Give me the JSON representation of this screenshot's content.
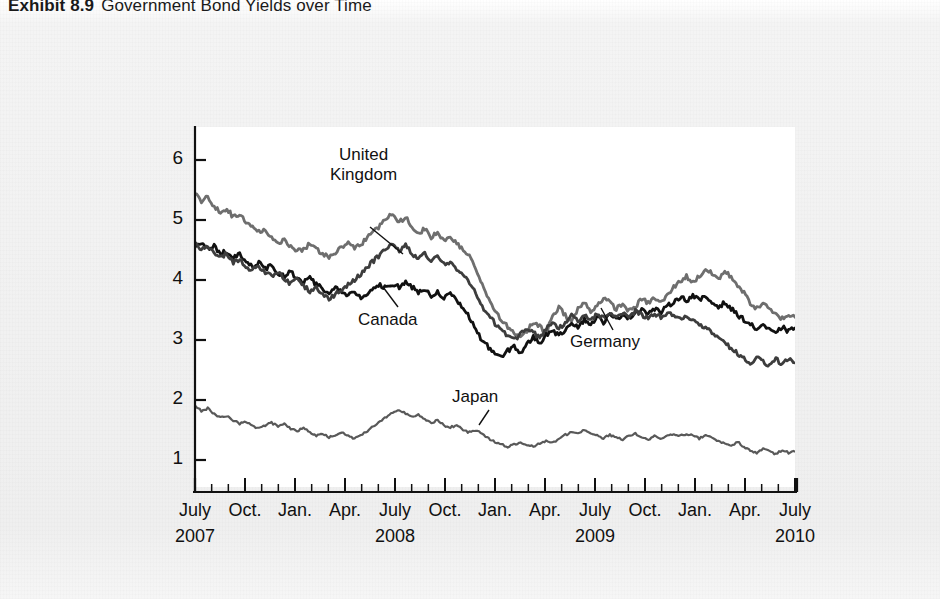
{
  "caption": {
    "exhibit_label": "Exhibit 8.9",
    "title": "Government Bond Yields over Time"
  },
  "chart_data": {
    "type": "line",
    "title": "Government Bond Yields over Time",
    "xlabel": "",
    "ylabel": "Percent",
    "ylim": [
      0.55,
      6.55
    ],
    "yticks": [
      1,
      2,
      3,
      4,
      5,
      6
    ],
    "ytick_labels": [
      "1",
      "2",
      "3",
      "4",
      "5",
      "6"
    ],
    "grid": false,
    "legend": "inline-annotations",
    "x_axis": {
      "tick_interval": "monthly",
      "major_tick_interval": "quarterly",
      "month_labels": [
        "July",
        "Oct.",
        "Jan.",
        "Apr.",
        "July",
        "Oct.",
        "Jan.",
        "Apr.",
        "July",
        "Oct.",
        "Jan.",
        "Apr.",
        "July"
      ],
      "year_labels": [
        "2007",
        "2008",
        "2009",
        "2010"
      ],
      "year_label_at_month": [
        "July",
        "July",
        "July",
        "July"
      ],
      "range": [
        "2007-07",
        "2010-08"
      ]
    },
    "annotations": [
      {
        "text": "United Kingdom",
        "series": "United Kingdom",
        "color": "#6e6e6e"
      },
      {
        "text": "Canada",
        "series": "Canada",
        "color": "#111111"
      },
      {
        "text": "Germany",
        "series": "Germany",
        "color": "#3d3d3d"
      },
      {
        "text": "Japan",
        "series": "Japan",
        "color": "#595959"
      }
    ],
    "series": [
      {
        "name": "United Kingdom",
        "color": "#6e6e6e",
        "values": [
          5.45,
          5.28,
          5.4,
          5.22,
          5.12,
          5.18,
          5.05,
          5.1,
          4.95,
          4.88,
          4.8,
          4.86,
          4.7,
          4.62,
          4.66,
          4.55,
          4.48,
          4.52,
          4.6,
          4.52,
          4.44,
          4.38,
          4.46,
          4.55,
          4.62,
          4.52,
          4.6,
          4.7,
          4.82,
          4.9,
          5.02,
          5.12,
          4.96,
          5.06,
          4.9,
          4.78,
          4.86,
          4.72,
          4.78,
          4.66,
          4.74,
          4.6,
          4.5,
          4.4,
          4.2,
          3.92,
          3.7,
          3.48,
          3.34,
          3.22,
          3.1,
          3.02,
          3.15,
          3.3,
          3.22,
          3.12,
          3.4,
          3.55,
          3.42,
          3.3,
          3.52,
          3.62,
          3.48,
          3.58,
          3.7,
          3.62,
          3.52,
          3.6,
          3.48,
          3.56,
          3.68,
          3.62,
          3.7,
          3.62,
          3.74,
          3.88,
          3.98,
          4.06,
          3.96,
          4.06,
          4.18,
          4.1,
          4.02,
          4.14,
          4.05,
          3.92,
          3.78,
          3.62,
          3.52,
          3.62,
          3.5,
          3.42,
          3.36,
          3.42,
          3.38
        ]
      },
      {
        "name": "Canada",
        "color": "#111111",
        "values": [
          4.58,
          4.62,
          4.52,
          4.56,
          4.44,
          4.48,
          4.38,
          4.42,
          4.3,
          4.22,
          4.3,
          4.18,
          4.24,
          4.12,
          4.06,
          4.14,
          4.02,
          3.96,
          4.04,
          3.92,
          3.86,
          3.78,
          3.88,
          3.8,
          3.74,
          3.8,
          3.7,
          3.78,
          3.84,
          3.92,
          3.86,
          3.94,
          3.88,
          3.96,
          3.88,
          3.8,
          3.86,
          3.74,
          3.8,
          3.7,
          3.76,
          3.66,
          3.52,
          3.38,
          3.18,
          2.98,
          2.88,
          2.78,
          2.7,
          2.82,
          2.9,
          2.78,
          2.92,
          3.05,
          2.95,
          3.08,
          3.18,
          3.06,
          3.18,
          3.3,
          3.22,
          3.34,
          3.26,
          3.38,
          3.3,
          3.42,
          3.34,
          3.44,
          3.36,
          3.46,
          3.52,
          3.44,
          3.52,
          3.46,
          3.56,
          3.64,
          3.72,
          3.66,
          3.74,
          3.66,
          3.72,
          3.62,
          3.56,
          3.62,
          3.52,
          3.42,
          3.34,
          3.26,
          3.18,
          3.26,
          3.16,
          3.1,
          3.22,
          3.14,
          3.2
        ]
      },
      {
        "name": "Germany",
        "color": "#3d3d3d",
        "values": [
          4.6,
          4.52,
          4.56,
          4.46,
          4.38,
          4.44,
          4.3,
          4.34,
          4.22,
          4.16,
          4.24,
          4.12,
          4.06,
          4.14,
          4.0,
          3.94,
          4.02,
          3.9,
          3.82,
          3.88,
          3.78,
          3.7,
          3.76,
          3.84,
          3.92,
          4.0,
          4.1,
          4.22,
          4.32,
          4.42,
          4.54,
          4.62,
          4.5,
          4.58,
          4.44,
          4.36,
          4.44,
          4.32,
          4.38,
          4.26,
          4.3,
          4.18,
          4.08,
          3.96,
          3.78,
          3.56,
          3.4,
          3.28,
          3.18,
          3.08,
          3.0,
          3.1,
          3.2,
          3.12,
          3.04,
          3.18,
          3.28,
          3.18,
          3.3,
          3.4,
          3.32,
          3.42,
          3.34,
          3.44,
          3.36,
          3.46,
          3.38,
          3.46,
          3.4,
          3.48,
          3.42,
          3.36,
          3.44,
          3.38,
          3.46,
          3.4,
          3.34,
          3.4,
          3.32,
          3.26,
          3.2,
          3.12,
          3.02,
          2.94,
          2.86,
          2.78,
          2.7,
          2.62,
          2.72,
          2.64,
          2.58,
          2.68,
          2.6,
          2.7,
          2.62
        ]
      },
      {
        "name": "Japan",
        "color": "#595959",
        "values": [
          1.9,
          1.82,
          1.86,
          1.76,
          1.7,
          1.74,
          1.66,
          1.6,
          1.64,
          1.56,
          1.52,
          1.58,
          1.62,
          1.56,
          1.6,
          1.52,
          1.48,
          1.54,
          1.46,
          1.4,
          1.44,
          1.38,
          1.42,
          1.46,
          1.4,
          1.36,
          1.42,
          1.48,
          1.56,
          1.64,
          1.72,
          1.8,
          1.84,
          1.78,
          1.72,
          1.76,
          1.68,
          1.62,
          1.66,
          1.58,
          1.54,
          1.58,
          1.5,
          1.46,
          1.5,
          1.44,
          1.36,
          1.3,
          1.26,
          1.22,
          1.26,
          1.3,
          1.26,
          1.22,
          1.28,
          1.32,
          1.28,
          1.34,
          1.42,
          1.46,
          1.44,
          1.5,
          1.44,
          1.4,
          1.36,
          1.42,
          1.38,
          1.34,
          1.4,
          1.44,
          1.38,
          1.34,
          1.4,
          1.36,
          1.4,
          1.44,
          1.4,
          1.44,
          1.4,
          1.36,
          1.42,
          1.38,
          1.32,
          1.28,
          1.24,
          1.3,
          1.22,
          1.16,
          1.12,
          1.18,
          1.14,
          1.1,
          1.16,
          1.12,
          1.14
        ]
      }
    ]
  }
}
